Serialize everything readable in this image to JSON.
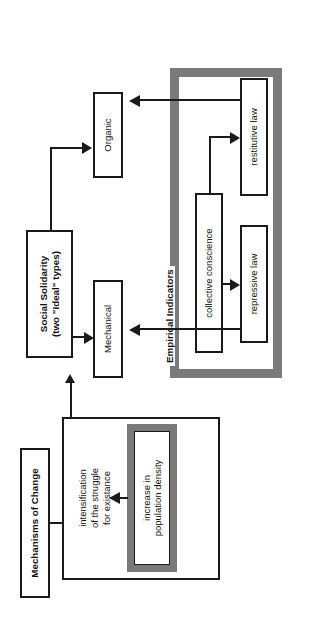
{
  "diagram": {
    "groups": [
      {
        "id": "mechanisms",
        "label": "Mechanisms of Change"
      },
      {
        "id": "solidarity",
        "label": "Social Solidarity\n(two \"Ideal\" types)",
        "label_line1": "Social Solidarity",
        "label_line2": "(two \"Ideal\" types)"
      },
      {
        "id": "empirical",
        "label": "Empirical Indicators"
      }
    ],
    "nodes": [
      {
        "id": "population-density",
        "label_line1": "increase in",
        "label_line2": "population density"
      },
      {
        "id": "struggle",
        "label_line1": "intensification",
        "label_line2": "of the struggle",
        "label_line3": "for existance"
      },
      {
        "id": "mechanical",
        "label": "Mechanical"
      },
      {
        "id": "organic",
        "label": "Organic"
      },
      {
        "id": "collective-conscience",
        "label": "collective conscience"
      },
      {
        "id": "repressive-law",
        "label": "repressive law"
      },
      {
        "id": "restitutive-law",
        "label": "restitutive law"
      }
    ],
    "colors": {
      "stroke": "#1a1a1a",
      "frame_gray": "#7a7a7a",
      "background": "#ffffff"
    }
  }
}
